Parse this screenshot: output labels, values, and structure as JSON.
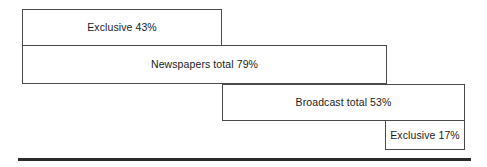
{
  "chart_data": {
    "type": "bar",
    "title": "",
    "subtitle": "",
    "xlabel": "",
    "ylabel": "",
    "orientation": "horizontal",
    "style": "stepped-cascade-outline",
    "grid": false,
    "legend": null,
    "xlim": [
      0,
      100
    ],
    "categories": [
      "Exclusive",
      "Newspapers total",
      "Broadcast total",
      "Exclusive"
    ],
    "values": [
      43,
      79,
      53,
      17
    ],
    "units": "%",
    "bars": [
      {
        "label": "Exclusive 43%",
        "category": "Exclusive",
        "value": 43,
        "start": 0,
        "end": 43,
        "group": "Newspapers"
      },
      {
        "label": "Newspapers total 79%",
        "category": "Newspapers total",
        "value": 79,
        "start": 0,
        "end": 79,
        "group": "Newspapers"
      },
      {
        "label": "Broadcast total 53%",
        "category": "Broadcast total",
        "value": 53,
        "start": 47,
        "end": 100,
        "group": "Broadcast"
      },
      {
        "label": "Exclusive 17%",
        "category": "Exclusive",
        "value": 17,
        "start": 83,
        "end": 100,
        "group": "Broadcast"
      }
    ],
    "colors": {
      "bar_fill": "#ffffff",
      "bar_stroke": "#4a4a4a",
      "label_text": "#1a1a1a",
      "baseline_rule": "#2b2b2b",
      "background": "#ffffff"
    }
  }
}
